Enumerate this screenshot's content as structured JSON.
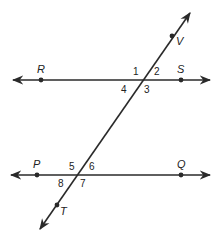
{
  "diagram": {
    "type": "parallel-lines-cut-by-transversal",
    "stroke_color": "#2a2a2a",
    "background": "#ffffff",
    "lines": [
      {
        "name": "line-RS",
        "points": [
          "R",
          "S"
        ]
      },
      {
        "name": "line-PQ",
        "points": [
          "P",
          "Q"
        ]
      },
      {
        "name": "transversal-VT",
        "points": [
          "V",
          "T"
        ]
      }
    ],
    "points": {
      "R": "R",
      "S": "S",
      "P": "P",
      "Q": "Q",
      "V": "V",
      "T": "T"
    },
    "angles": {
      "a1": "1",
      "a2": "2",
      "a3": "3",
      "a4": "4",
      "a5": "5",
      "a6": "6",
      "a7": "7",
      "a8": "8"
    }
  }
}
